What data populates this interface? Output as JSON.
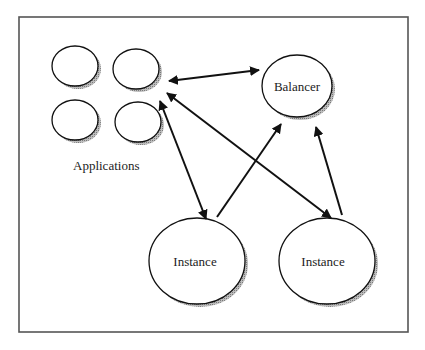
{
  "diagram": {
    "type": "architecture",
    "frame": {
      "x": 19,
      "y": 17,
      "width": 389,
      "height": 315,
      "stroke": "#555555"
    },
    "colors": {
      "stroke": "#111111",
      "shadow": "#9a9a9a",
      "fill": "#ffffff",
      "text": "#222222"
    },
    "nodes": {
      "app1": {
        "label": "",
        "cx": 75,
        "cy": 66,
        "rx": 23,
        "ry": 20
      },
      "app2": {
        "label": "",
        "cx": 136,
        "cy": 69,
        "rx": 23,
        "ry": 20
      },
      "app3": {
        "label": "",
        "cx": 75,
        "cy": 120,
        "rx": 23,
        "ry": 20
      },
      "app4": {
        "label": "",
        "cx": 138,
        "cy": 122,
        "rx": 23,
        "ry": 20
      },
      "balancer": {
        "label": "Balancer",
        "cx": 297,
        "cy": 86,
        "rx": 35,
        "ry": 31
      },
      "instance1": {
        "label": "Instance",
        "cx": 197,
        "cy": 261,
        "rx": 48,
        "ry": 43
      },
      "instance2": {
        "label": "Instance",
        "cx": 327,
        "cy": 261,
        "rx": 48,
        "ry": 43
      }
    },
    "group_label": "Applications",
    "edges": [
      {
        "from": "applications",
        "to": "balancer",
        "bidirectional": true
      },
      {
        "from": "applications",
        "to": "instance1",
        "bidirectional": true
      },
      {
        "from": "applications",
        "to": "instance2",
        "bidirectional": true
      },
      {
        "from": "instance1",
        "to": "balancer",
        "bidirectional": false
      },
      {
        "from": "instance2",
        "to": "balancer",
        "bidirectional": false
      }
    ]
  }
}
